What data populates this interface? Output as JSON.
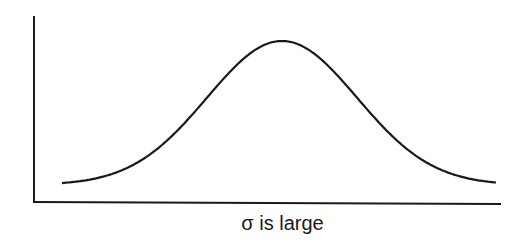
{
  "chart_data": {
    "type": "line",
    "title": "",
    "xlabel": "σ is large",
    "ylabel": "",
    "series": [
      {
        "name": "normal distribution",
        "description": "Wide, flat bell curve (large standard deviation)",
        "x": [
          -3,
          -2.5,
          -2,
          -1.5,
          -1,
          -0.5,
          0,
          0.5,
          1,
          1.5,
          2,
          2.5,
          3
        ],
        "values": [
          0.011,
          0.044,
          0.135,
          0.325,
          0.607,
          0.882,
          1.0,
          0.882,
          0.607,
          0.325,
          0.135,
          0.044,
          0.011
        ]
      }
    ],
    "grid": false,
    "legend": null,
    "axes": {
      "x_ticks": [],
      "y_ticks": []
    },
    "colors": {
      "curve": "#1a1a1a",
      "axes": "#1a1a1a"
    }
  },
  "caption": {
    "symbol": "σ",
    "text": "σ  is large"
  }
}
